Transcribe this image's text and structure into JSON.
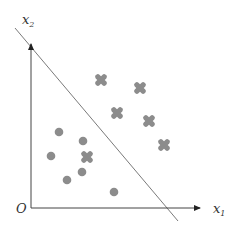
{
  "diagram": {
    "type": "linear-classifier-scatter",
    "axes": {
      "x_label": "x",
      "x_subscript": "1",
      "y_label": "x",
      "y_subscript": "2",
      "origin_label": "O"
    },
    "colors": {
      "axis": "#444444",
      "boundary": "#7a7a7a",
      "marker": "#8c8c8c"
    },
    "decision_boundary": {
      "x1": 15,
      "y1": 28,
      "x2": 178,
      "y2": 221
    },
    "class_cross": [
      {
        "x": 101,
        "y": 80
      },
      {
        "x": 140,
        "y": 88
      },
      {
        "x": 117,
        "y": 113
      },
      {
        "x": 149,
        "y": 121
      },
      {
        "x": 164,
        "y": 145
      },
      {
        "x": 87,
        "y": 157
      }
    ],
    "class_circle": [
      {
        "x": 59,
        "y": 132
      },
      {
        "x": 83,
        "y": 141
      },
      {
        "x": 51,
        "y": 156
      },
      {
        "x": 82,
        "y": 172
      },
      {
        "x": 67,
        "y": 180
      },
      {
        "x": 114,
        "y": 192
      }
    ]
  }
}
